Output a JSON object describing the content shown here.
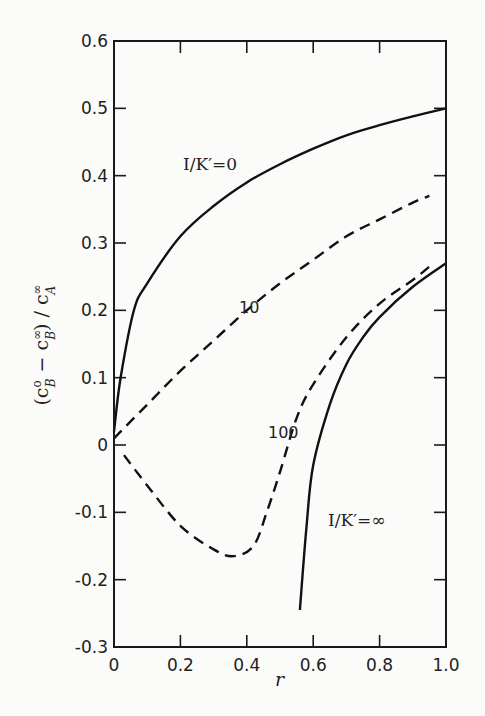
{
  "chart_data": {
    "type": "line",
    "title": "",
    "xlabel": "r",
    "ylabel": "(c_B^0 - c_B^∞) / c_A^∞",
    "xlim": [
      0,
      1.0
    ],
    "ylim": [
      -0.3,
      0.6
    ],
    "x_ticks": [
      "0",
      "0.2",
      "0.4",
      "0.6",
      "0.8",
      "1.0"
    ],
    "y_ticks": [
      "-0.3",
      "-0.2",
      "-0.1",
      "0",
      "0.1",
      "0.2",
      "0.3",
      "0.4",
      "0.5",
      "0.6"
    ],
    "grid": false,
    "legend": "inline curve labels",
    "series": [
      {
        "name": "I/K'=0",
        "style": "solid",
        "x": [
          0,
          0.02,
          0.06,
          0.1,
          0.2,
          0.3,
          0.4,
          0.5,
          0.6,
          0.7,
          0.8,
          0.9,
          1.0
        ],
        "y": [
          0.02,
          0.1,
          0.2,
          0.24,
          0.31,
          0.355,
          0.39,
          0.417,
          0.44,
          0.46,
          0.475,
          0.488,
          0.5
        ]
      },
      {
        "name": "10",
        "style": "dashed",
        "x": [
          0,
          0.1,
          0.2,
          0.3,
          0.4,
          0.5,
          0.6,
          0.7,
          0.8,
          0.9,
          0.95
        ],
        "y": [
          0.01,
          0.06,
          0.11,
          0.155,
          0.2,
          0.24,
          0.275,
          0.31,
          0.335,
          0.36,
          0.37
        ]
      },
      {
        "name": "100",
        "style": "dashed",
        "x": [
          0.03,
          0.1,
          0.2,
          0.3,
          0.36,
          0.42,
          0.46,
          0.5,
          0.55,
          0.6,
          0.7,
          0.8,
          0.9,
          0.95
        ],
        "y": [
          -0.015,
          -0.06,
          -0.12,
          -0.155,
          -0.165,
          -0.15,
          -0.1,
          -0.04,
          0.04,
          0.09,
          0.16,
          0.21,
          0.245,
          0.265
        ]
      },
      {
        "name": "I/K'=∞",
        "style": "solid",
        "x": [
          0.56,
          0.58,
          0.6,
          0.65,
          0.7,
          0.75,
          0.8,
          0.9,
          1.0
        ],
        "y": [
          -0.245,
          -0.12,
          -0.03,
          0.06,
          0.12,
          0.16,
          0.19,
          0.235,
          0.27
        ]
      }
    ],
    "annotations": [
      {
        "text": "I/K'=0",
        "x": 0.32,
        "y": 0.38
      },
      {
        "text": "10",
        "x": 0.28,
        "y": 0.2
      },
      {
        "text": "100",
        "x": 0.5,
        "y": 0.02
      },
      {
        "text": "I/K'=∞",
        "x": 0.75,
        "y": -0.06
      }
    ]
  },
  "labels": {
    "xlabel": "r",
    "ylabel_prefix": "(c",
    "ylabel_full": "(cB⁰ − cB^∞) / cA^∞",
    "curve_0": "I/K′=0",
    "curve_10": "10",
    "curve_100": "100",
    "curve_inf": "I/K′=∞"
  }
}
